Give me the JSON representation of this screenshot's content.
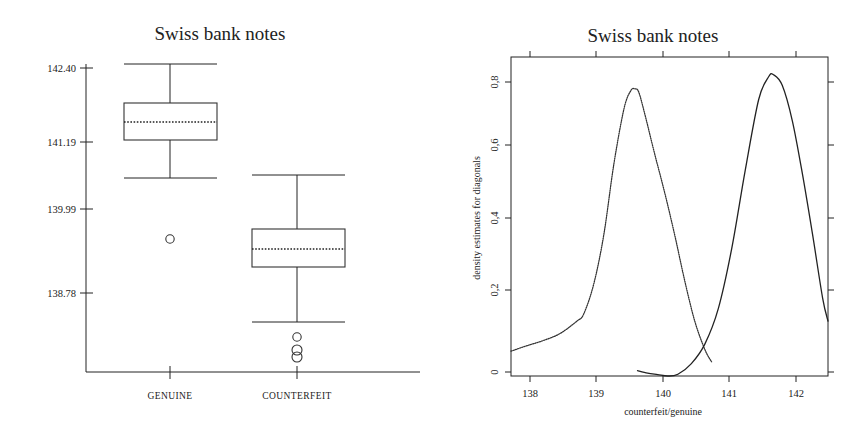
{
  "figure": {
    "background": "#ffffff",
    "ink": "#222222"
  },
  "boxplot_panel": {
    "title": "Swiss bank notes",
    "y_tick_labels": [
      "142.40",
      "141.19",
      "139.99",
      "138.78"
    ],
    "category_labels": [
      "GENUINE",
      "COUNTERFEIT"
    ]
  },
  "density_panel": {
    "title": "Swiss bank notes",
    "y_axis_label": "density estimates for diagonals",
    "x_axis_label": "counterfeit/genuine",
    "x_tick_labels": [
      "138",
      "139",
      "140",
      "141",
      "142"
    ],
    "y_tick_labels": [
      "0",
      "0,2",
      "0,4",
      "0,6",
      "0,8"
    ]
  },
  "chart_data": [
    {
      "type": "box",
      "title": "Swiss bank notes",
      "xlabel": "",
      "ylabel": "",
      "categories": [
        "GENUINE",
        "COUNTERFEIT"
      ],
      "ytick_values": [
        142.4,
        141.19,
        139.99,
        138.78
      ],
      "ylim": [
        137.95,
        142.65
      ],
      "grid": false,
      "legend": "none",
      "boxes": [
        {
          "name": "GENUINE",
          "whisker_high": 142.4,
          "q3": 141.72,
          "median": 141.5,
          "q1": 141.19,
          "whisker_low": 140.55,
          "outliers": [
            139.5
          ]
        },
        {
          "name": "COUNTERFEIT",
          "whisker_high": 140.55,
          "q3": 139.6,
          "median": 139.42,
          "q1": 139.11,
          "whisker_low": 138.12,
          "outliers": [
            137.88,
            137.69,
            137.57
          ]
        }
      ]
    },
    {
      "type": "line",
      "title": "Swiss bank notes",
      "xlabel": "counterfeit/genuine",
      "ylabel": "density estimates for diagonals",
      "xtick_values": [
        138,
        139,
        140,
        141,
        142
      ],
      "ytick_values": [
        0,
        0.2,
        0.4,
        0.6,
        0.8
      ],
      "xlim": [
        137.72,
        142.43
      ],
      "ylim": [
        0,
        0.9
      ],
      "grid": false,
      "legend": "none",
      "series": [
        {
          "name": "counterfeit",
          "style": "dotted",
          "x": [
            137.72,
            137.95,
            138.2,
            138.45,
            138.7,
            138.8,
            138.95,
            139.1,
            139.25,
            139.4,
            139.5,
            139.56,
            139.62,
            139.72,
            139.85,
            140.0,
            140.15,
            140.3,
            140.45,
            140.6,
            140.7
          ],
          "y": [
            0.07,
            0.085,
            0.1,
            0.12,
            0.155,
            0.175,
            0.26,
            0.4,
            0.6,
            0.755,
            0.805,
            0.81,
            0.8,
            0.73,
            0.63,
            0.52,
            0.4,
            0.27,
            0.155,
            0.075,
            0.04
          ]
        },
        {
          "name": "genuine",
          "style": "solid",
          "x": [
            139.6,
            139.75,
            139.9,
            140.05,
            140.2,
            140.4,
            140.6,
            140.8,
            141.0,
            141.2,
            141.4,
            141.55,
            141.62,
            141.75,
            141.9,
            142.05,
            142.2,
            142.35,
            142.43
          ],
          "y": [
            0.015,
            0.008,
            0.004,
            0.0,
            0.005,
            0.035,
            0.09,
            0.19,
            0.36,
            0.58,
            0.78,
            0.845,
            0.85,
            0.82,
            0.72,
            0.57,
            0.4,
            0.22,
            0.155
          ]
        }
      ]
    }
  ]
}
